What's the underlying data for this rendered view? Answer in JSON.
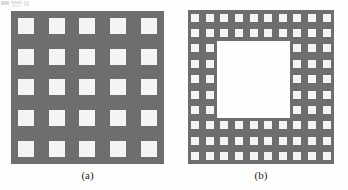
{
  "figure": {
    "kind": "two-panel-grid-diagram",
    "background_color": "#fdfdfb",
    "solid_color": "#6e6e6e",
    "hole_color": "#f4f4f2",
    "panels": [
      {
        "id": "a",
        "caption": "(a)",
        "grid_rows": 5,
        "grid_cols": 5,
        "square_count": 25,
        "description": "Solid gray square block containing a 5 by 5 array of white square holes",
        "hollow_center": false
      },
      {
        "id": "b",
        "caption": "(b)",
        "grid_rows": 10,
        "grid_cols": 10,
        "square_count": 75,
        "description": "Gray frame built from a 10 by 10 array of small white square holes, with the central 5 by 5 region removed to leave a large white opening",
        "hollow_center": true,
        "void_rows": [
          3,
          4,
          5,
          6,
          7
        ],
        "void_cols": [
          3,
          4,
          5,
          6,
          7
        ]
      }
    ]
  },
  "artifacts": {
    "label": "scan-noise"
  }
}
